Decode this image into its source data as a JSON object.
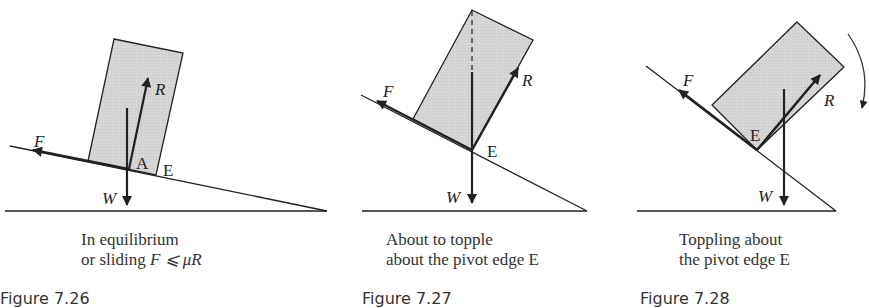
{
  "figures": [
    {
      "number": "Figure 7.26",
      "caption_line1": "In equilibrium",
      "caption_line2_prefix": "or sliding ",
      "caption_line2_math": "F ⩽ μR",
      "labels": {
        "F": "F",
        "R": "R",
        "A": "A",
        "E": "E",
        "W": "W"
      }
    },
    {
      "number": "Figure 7.27",
      "caption_line1": "About to topple",
      "caption_line2": "about the pivot edge E",
      "labels": {
        "F": "F",
        "R": "R",
        "E": "E",
        "W": "W"
      }
    },
    {
      "number": "Figure 7.28",
      "caption_line1": "Toppling about",
      "caption_line2": "the pivot edge E",
      "labels": {
        "F": "F",
        "R": "R",
        "E": "E",
        "W": "W"
      }
    }
  ],
  "colors": {
    "block_fill": "#d9d9d9",
    "line": "#222222"
  }
}
